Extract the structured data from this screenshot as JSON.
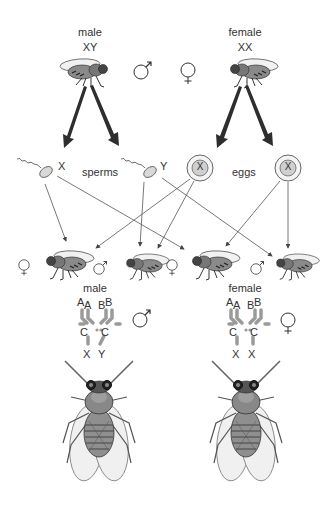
{
  "parents": {
    "male": {
      "label": "male",
      "genotype": "XY",
      "symbol": "♂"
    },
    "female": {
      "label": "female",
      "genotype": "XX",
      "symbol": "♀"
    }
  },
  "gametes": {
    "sperms_label": "sperms",
    "eggs_label": "eggs",
    "sperm_1": "X",
    "sperm_2": "Y",
    "egg_1": "X",
    "egg_2": "X"
  },
  "offspring": [
    {
      "sex": "female",
      "symbol": "♀"
    },
    {
      "sex": "male",
      "symbol": "♂"
    },
    {
      "sex": "female",
      "symbol": "♀"
    },
    {
      "sex": "male",
      "symbol": "♂"
    }
  ],
  "karyotypes": {
    "male": {
      "label": "male",
      "symbol": "♂",
      "pair_a": [
        "A",
        "A"
      ],
      "pair_b": [
        "B",
        "B"
      ],
      "pair_c": [
        "C",
        "C"
      ],
      "sex_chromosomes": [
        "X",
        "Y"
      ]
    },
    "female": {
      "label": "female",
      "symbol": "♀",
      "pair_a": [
        "A",
        "A"
      ],
      "pair_b": [
        "B",
        "B"
      ],
      "pair_c": [
        "C",
        "C"
      ],
      "sex_chromosomes": [
        "X",
        "X"
      ]
    }
  },
  "colors": {
    "fly_body": "#8a8a8a",
    "fly_dark": "#3a3a3a",
    "wing": "#ececec",
    "chromosome": "#9a9a9a",
    "arrow_big": "#2e2e2e",
    "line": "#555555"
  }
}
